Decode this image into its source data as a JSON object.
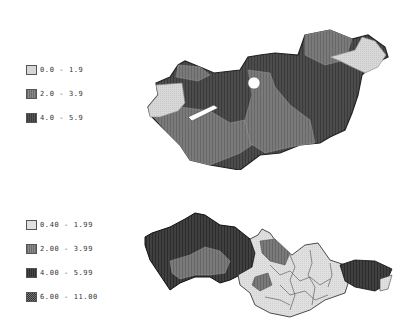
{
  "maps": [
    {
      "name": "Hungary",
      "legend": [
        {
          "label": "0.0 - 1.9",
          "color": "#d4d4d4"
        },
        {
          "label": "2.0 - 3.9",
          "color": "#7a7a7a"
        },
        {
          "label": "4.0 - 5.9",
          "color": "#4a4a4a"
        }
      ]
    },
    {
      "name": "Czechoslovakia",
      "legend": [
        {
          "label": "0.40 - 1.99",
          "color": "#dcdcdc"
        },
        {
          "label": "2.00 - 3.99",
          "color": "#7c7c7c"
        },
        {
          "label": "4.00 - 5.99",
          "color": "#3e3e3e"
        },
        {
          "label": "6.00 - 11.00",
          "color": "#555555"
        }
      ]
    }
  ]
}
